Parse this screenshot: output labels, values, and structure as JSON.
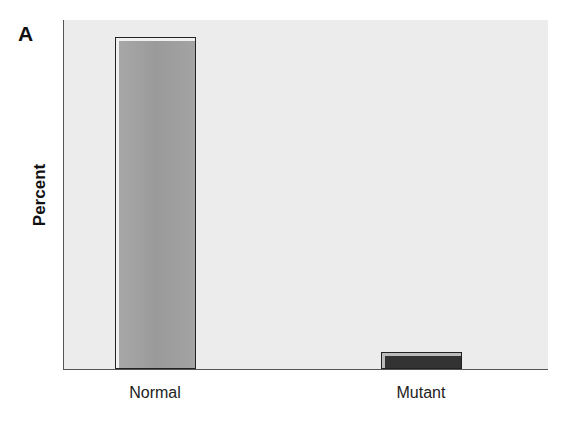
{
  "panel_label": "A",
  "chart_data": {
    "type": "bar",
    "title": "",
    "xlabel": "",
    "ylabel": "Percent",
    "categories": [
      "Normal",
      "Mutant"
    ],
    "values": [
      100,
      5
    ],
    "ylim": [
      0,
      105
    ],
    "grid": false,
    "legend": null,
    "colors": [
      "#a0a0a0",
      "#333333"
    ],
    "plot_background": "#ececec"
  }
}
